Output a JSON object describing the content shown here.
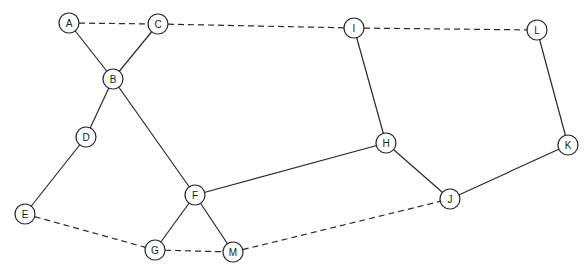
{
  "diagram": {
    "type": "undirected-graph",
    "node_radius": 10,
    "nodes": [
      {
        "id": "A",
        "label": "A",
        "x": 69,
        "y": 23
      },
      {
        "id": "C",
        "label": "C",
        "x": 158,
        "y": 24
      },
      {
        "id": "B",
        "label": "B",
        "x": 113,
        "y": 79
      },
      {
        "id": "D",
        "label": "D",
        "x": 86,
        "y": 137
      },
      {
        "id": "E",
        "label": "E",
        "x": 25,
        "y": 214
      },
      {
        "id": "F",
        "label": "F",
        "x": 195,
        "y": 195
      },
      {
        "id": "G",
        "label": "G",
        "x": 155,
        "y": 250
      },
      {
        "id": "M",
        "label": "M",
        "x": 233,
        "y": 252
      },
      {
        "id": "I",
        "label": "I",
        "x": 354,
        "y": 28
      },
      {
        "id": "L",
        "label": "L",
        "x": 537,
        "y": 30
      },
      {
        "id": "H",
        "label": "H",
        "x": 386,
        "y": 143
      },
      {
        "id": "K",
        "label": "K",
        "x": 568,
        "y": 145
      },
      {
        "id": "J",
        "label": "J",
        "x": 450,
        "y": 199
      }
    ],
    "edges": [
      {
        "from": "A",
        "to": "C",
        "style": "dashed"
      },
      {
        "from": "C",
        "to": "I",
        "style": "dashed"
      },
      {
        "from": "I",
        "to": "L",
        "style": "dashed"
      },
      {
        "from": "A",
        "to": "B",
        "style": "solid"
      },
      {
        "from": "C",
        "to": "B",
        "style": "solid"
      },
      {
        "from": "B",
        "to": "D",
        "style": "solid"
      },
      {
        "from": "D",
        "to": "E",
        "style": "solid"
      },
      {
        "from": "B",
        "to": "F",
        "style": "solid"
      },
      {
        "from": "F",
        "to": "H",
        "style": "solid"
      },
      {
        "from": "H",
        "to": "I",
        "style": "solid"
      },
      {
        "from": "H",
        "to": "J",
        "style": "solid"
      },
      {
        "from": "J",
        "to": "K",
        "style": "solid"
      },
      {
        "from": "K",
        "to": "L",
        "style": "solid"
      },
      {
        "from": "F",
        "to": "G",
        "style": "solid"
      },
      {
        "from": "F",
        "to": "M",
        "style": "solid"
      },
      {
        "from": "E",
        "to": "G",
        "style": "dashed"
      },
      {
        "from": "G",
        "to": "M",
        "style": "dashed"
      },
      {
        "from": "M",
        "to": "J",
        "style": "dashed"
      }
    ]
  }
}
